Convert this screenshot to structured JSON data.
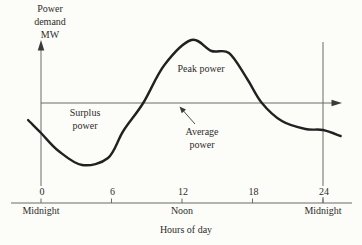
{
  "figure": {
    "background": "#fcfcf9",
    "axis_color": "#6b6b6b",
    "curve_color": "#212121",
    "text_color": "#2e2c2a"
  },
  "labels": {
    "surplus": "Surplus power",
    "peak": "Peak power",
    "average": "Average power"
  },
  "chart_data": {
    "type": "line",
    "title": "",
    "ylabel": "Power demand MW",
    "ylabel_lines": [
      "Power",
      "demand",
      "MW"
    ],
    "xlabel": "Hours of day",
    "x_ticks": [
      0,
      6,
      12,
      18,
      24
    ],
    "x_tick_labels": [
      "0",
      "6",
      "12",
      "18",
      "24"
    ],
    "x_tick_sublabels": [
      "Midnight",
      "",
      "Noon",
      "",
      "Midnight"
    ],
    "x_range_hours": [
      -1.1,
      25.5
    ],
    "y_axis_has_numeric_ticks": false,
    "grid": false,
    "legend": null,
    "average_line_value": 1.0,
    "annotations": [
      "Surplus power",
      "Peak power",
      "Average power"
    ],
    "series": [
      {
        "name": "Power demand",
        "units": "relative to average power (1.0 = average line, estimated from figure)",
        "points": [
          {
            "h": -1.1,
            "v": 0.83
          },
          {
            "h": 0.0,
            "v": 0.7
          },
          {
            "h": 1.5,
            "v": 0.52
          },
          {
            "h": 3.5,
            "v": 0.38
          },
          {
            "h": 5.7,
            "v": 0.45
          },
          {
            "h": 7.0,
            "v": 0.72
          },
          {
            "h": 8.7,
            "v": 1.0
          },
          {
            "h": 10.5,
            "v": 1.38
          },
          {
            "h": 12.8,
            "v": 1.63
          },
          {
            "h": 14.5,
            "v": 1.52
          },
          {
            "h": 16.0,
            "v": 1.5
          },
          {
            "h": 17.5,
            "v": 1.25
          },
          {
            "h": 18.8,
            "v": 1.0
          },
          {
            "h": 20.5,
            "v": 0.82
          },
          {
            "h": 22.5,
            "v": 0.74
          },
          {
            "h": 24.0,
            "v": 0.73
          },
          {
            "h": 25.5,
            "v": 0.67
          }
        ]
      }
    ]
  }
}
